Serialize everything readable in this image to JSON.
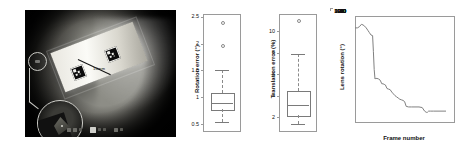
{
  "figure": {
    "panels": [
      "photo",
      "rotation-error-boxplot",
      "translation-error-boxplot",
      "lens-rotation-line"
    ]
  },
  "photo": {
    "name": "endoscope-calibration-photo",
    "scale_label": "10mm",
    "marker_left": "aruco-marker",
    "marker_right": "aruco-marker",
    "callout_small": "region-of-interest-circle",
    "callout_large": "magnified-inset-circle",
    "toolbar_items": [
      "play",
      "stop",
      "step",
      "record",
      "marker",
      "grid",
      "zoom",
      "settings"
    ]
  },
  "chart_data": [
    {
      "type": "boxplot",
      "name": "rotation-error",
      "title": "",
      "xlabel": "",
      "ylabel": "Rotation error (°)",
      "ylim": [
        0.35,
        2.55
      ],
      "yticks": [
        0.5,
        1,
        1.5,
        2,
        2.5
      ],
      "ytick_labels": [
        "0.5",
        "1",
        "1.5",
        "2",
        "2.5"
      ],
      "grid": false,
      "categories": [
        "all"
      ],
      "boxes": [
        {
          "label": "all",
          "whisker_low": 0.53,
          "q1": 0.78,
          "median": 0.9,
          "q3": 1.08,
          "whisker_high": 1.5,
          "outliers": [
            1.97,
            2.4
          ]
        }
      ]
    },
    {
      "type": "boxplot",
      "name": "translation-error",
      "title": "",
      "xlabel": "",
      "ylabel": "Translation error (%)",
      "ylim": [
        0.6,
        11.6
      ],
      "yticks": [
        2,
        4,
        6,
        8,
        10
      ],
      "ytick_labels": [
        "2",
        "4",
        "6",
        "8",
        "10"
      ],
      "grid": false,
      "categories": [
        "all"
      ],
      "boxes": [
        {
          "label": "all",
          "whisker_low": 1.3,
          "q1": 2.2,
          "median": 3.1,
          "q3": 4.4,
          "whisker_high": 7.9,
          "outliers": [
            11.0
          ]
        }
      ]
    },
    {
      "type": "line",
      "name": "lens-rotation-vs-frame",
      "title": "",
      "xlabel": "Frame number",
      "ylabel": "Lens rotation (°)",
      "xlim": [
        0,
        500
      ],
      "ylim": [
        -80,
        100
      ],
      "xticks": [
        0,
        100,
        200,
        300,
        400,
        500
      ],
      "xtick_labels": [
        "0",
        "100",
        "200",
        "300",
        "400",
        "500"
      ],
      "yticks": [
        -80,
        -60,
        -40,
        -20,
        0,
        20,
        40,
        60,
        80,
        100
      ],
      "ytick_labels": [
        "-80",
        "-60",
        "-40",
        "-20",
        "0",
        "20",
        "40",
        "60",
        "80",
        "100"
      ],
      "grid": false,
      "legend": null,
      "series": [
        {
          "name": "Lens rotation",
          "color": "#808080",
          "x": [
            0,
            12,
            22,
            32,
            40,
            48,
            56,
            64,
            72,
            80,
            88,
            92,
            96,
            100,
            104,
            110,
            118,
            126,
            134,
            140,
            146,
            152,
            160,
            168,
            176,
            184,
            192,
            200,
            208,
            216,
            224,
            232,
            240,
            248,
            256,
            268,
            282,
            300,
            320,
            336,
            348,
            356,
            362,
            368,
            378,
            392,
            410,
            430,
            455
          ],
          "y": [
            80,
            80,
            82,
            86,
            85,
            83,
            80,
            76,
            72,
            68,
            67,
            40,
            10,
            -6,
            -5,
            -5,
            -6,
            -8,
            -14,
            -14,
            -15,
            -16,
            -22,
            -23,
            -24,
            -28,
            -31,
            -34,
            -36,
            -38,
            -40,
            -41,
            -42,
            -44,
            -52,
            -53,
            -53,
            -53,
            -53,
            -54,
            -60,
            -62,
            -62,
            -60,
            -60,
            -60,
            -60,
            -60,
            -60
          ]
        }
      ]
    }
  ]
}
